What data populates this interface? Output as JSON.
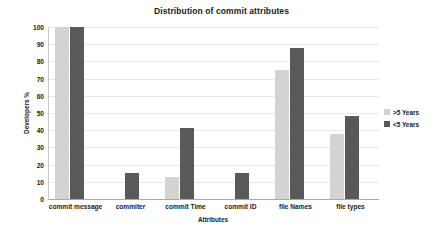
{
  "chart_data": {
    "type": "bar",
    "title": "Distribution of commit attributes",
    "xlabel": "Attributes",
    "ylabel": "Developers %",
    "categories": [
      "commit message",
      "commiter",
      "commit Time",
      "commit ID",
      "file Names",
      "file types"
    ],
    "series": [
      {
        "name": ">5 Years",
        "color": "#d3d3d3",
        "values": [
          100,
          0,
          13,
          0,
          75,
          38
        ]
      },
      {
        "name": "<5 Years",
        "color": "#595959",
        "values": [
          100,
          15,
          41,
          15,
          88,
          48
        ]
      }
    ],
    "ylim": [
      0,
      100
    ],
    "yticks": [
      0,
      10,
      20,
      30,
      40,
      50,
      60,
      70,
      80,
      90,
      100
    ],
    "ytick_labels": [
      "0",
      "10",
      "20",
      "30",
      "40",
      "50",
      "60",
      "70",
      "80",
      "90",
      "100"
    ],
    "grid": true,
    "legend_position": "right",
    "background_color": "#ffffff",
    "gridline_color": "#e8e8e8",
    "axis_color": "#aaaaaa",
    "text_color": "#1a1a1a"
  }
}
